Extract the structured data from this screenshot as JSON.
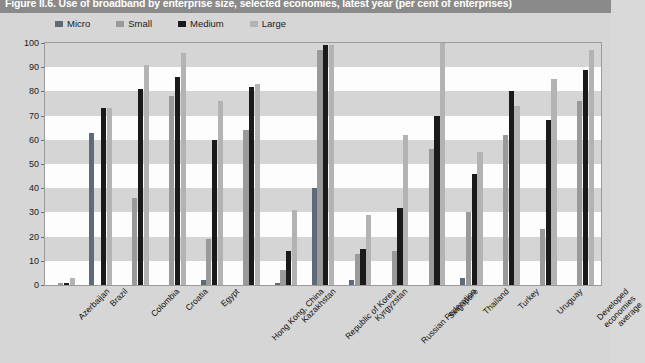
{
  "figure": {
    "title": "Figure II.6. Use of broadband by enterprise size, selected economies, latest year (per cent of enterprises)"
  },
  "legend": {
    "position": "top-left",
    "items": [
      {
        "label": "Micro",
        "color": "#5f6a78"
      },
      {
        "label": "Small",
        "color": "#9a9a9a"
      },
      {
        "label": "Medium",
        "color": "#1a1a1a"
      },
      {
        "label": "Large",
        "color": "#b3b3b3"
      }
    ]
  },
  "axis": {
    "y_ticks": [
      "0",
      "10",
      "20",
      "30",
      "40",
      "50",
      "60",
      "70",
      "80",
      "90",
      "100"
    ]
  },
  "chart_data": {
    "type": "bar",
    "title": "Figure II.6. Use of broadband by enterprise size, selected economies, latest year (per cent of enterprises)",
    "xlabel": "",
    "ylabel": "",
    "ylim": [
      0,
      100
    ],
    "ytick_step": 10,
    "grid": "horizontal-bands",
    "legend_position": "top-left",
    "categories": [
      "Azerbaijan",
      "Brazil",
      "Colombia",
      "Croatia",
      "Egypt",
      "Hong Kong, China",
      "Kazakhstan",
      "Republic of Korea",
      "Kyrgyzstan",
      "Russian Federation",
      "Singapore",
      "Thailand",
      "Turkey",
      "Uruguay",
      "Developed\neconomies average"
    ],
    "series": [
      {
        "name": "Micro",
        "color": "#5f6a78",
        "values": [
          0,
          63,
          0,
          0,
          2,
          0,
          1,
          40,
          2,
          0,
          0,
          3,
          0,
          0,
          0
        ]
      },
      {
        "name": "Small",
        "color": "#9a9a9a",
        "values": [
          1,
          0,
          36,
          78,
          19,
          64,
          6,
          97,
          13,
          14,
          56,
          30,
          62,
          23,
          76
        ]
      },
      {
        "name": "Medium",
        "color": "#1a1a1a",
        "values": [
          1,
          73,
          81,
          86,
          60,
          82,
          14,
          99,
          15,
          32,
          70,
          46,
          80,
          68,
          89
        ]
      },
      {
        "name": "Large",
        "color": "#b3b3b3",
        "values": [
          3,
          73,
          91,
          96,
          76,
          83,
          31,
          99,
          29,
          62,
          100,
          55,
          74,
          85,
          97
        ]
      }
    ]
  }
}
